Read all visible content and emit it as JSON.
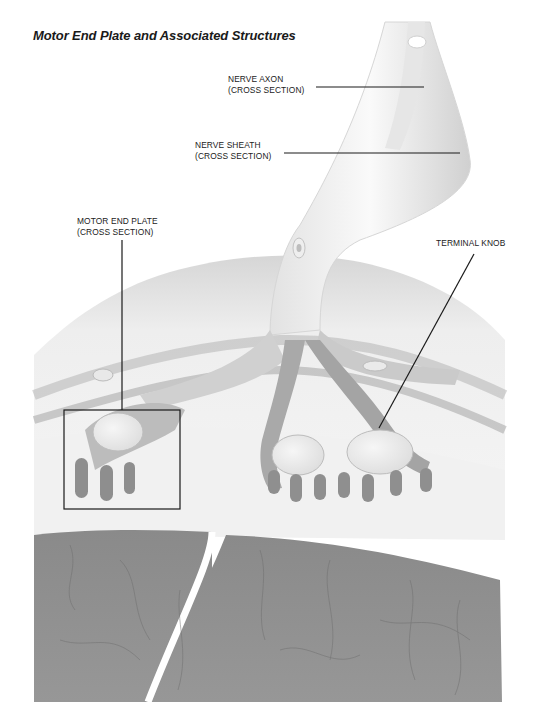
{
  "figure": {
    "title": "Motor End Plate and Associated Structures",
    "colors": {
      "background": "#ffffff",
      "muscle_fiber": "#8c8c8c",
      "tissue": "#ededed",
      "nerve": "#f4f4f4",
      "leader_line": "#1a1a1a"
    }
  },
  "labels": [
    {
      "id": "nerve-axon",
      "line1": "NERVE AXON",
      "line2": "(CROSS SECTION)"
    },
    {
      "id": "nerve-sheath",
      "line1": "NERVE SHEATH",
      "line2": "(CROSS SECTION)"
    },
    {
      "id": "motor-end-plate",
      "line1": "MOTOR END PLATE",
      "line2": "(CROSS SECTION)"
    },
    {
      "id": "terminal-knob",
      "line1": "TERMINAL KNOB"
    }
  ]
}
